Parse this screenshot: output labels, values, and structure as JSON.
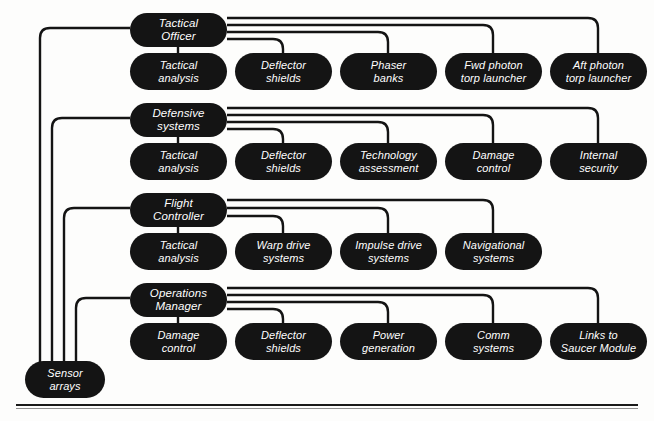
{
  "diagram": {
    "type": "org-tree",
    "title": "",
    "line_color": "#141414",
    "node_color": "#141414",
    "node_text_color": "#ffffff",
    "background": "#fdfdfc",
    "shared_source": {
      "id": "sensor-arrays",
      "label": "Sensor\narrays"
    },
    "groups": [
      {
        "id": "tactical-officer",
        "parent": {
          "label": "Tactical\nOfficer"
        },
        "children": [
          {
            "label": "Tactical\nanalysis"
          },
          {
            "label": "Deflector\nshields"
          },
          {
            "label": "Phaser\nbanks"
          },
          {
            "label": "Fwd photon\ntorp launcher"
          },
          {
            "label": "Aft photon\ntorp launcher"
          }
        ]
      },
      {
        "id": "defensive-systems",
        "parent": {
          "label": "Defensive\nsystems"
        },
        "children": [
          {
            "label": "Tactical\nanalysis"
          },
          {
            "label": "Deflector\nshields"
          },
          {
            "label": "Technology\nassessment"
          },
          {
            "label": "Damage\ncontrol"
          },
          {
            "label": "Internal\nsecurity"
          }
        ]
      },
      {
        "id": "flight-controller",
        "parent": {
          "label": "Flight\nController"
        },
        "children": [
          {
            "label": "Tactical\nanalysis"
          },
          {
            "label": "Warp drive\nsystems"
          },
          {
            "label": "Impulse drive\nsystems"
          },
          {
            "label": "Navigational\nsystems"
          }
        ]
      },
      {
        "id": "operations-manager",
        "parent": {
          "label": "Operations\nManager"
        },
        "children": [
          {
            "label": "Damage\ncontrol"
          },
          {
            "label": "Deflector\nshields"
          },
          {
            "label": "Power\ngeneration"
          },
          {
            "label": "Comm\nsystems"
          },
          {
            "label": "Links to\nSaucer Module"
          }
        ]
      }
    ]
  }
}
